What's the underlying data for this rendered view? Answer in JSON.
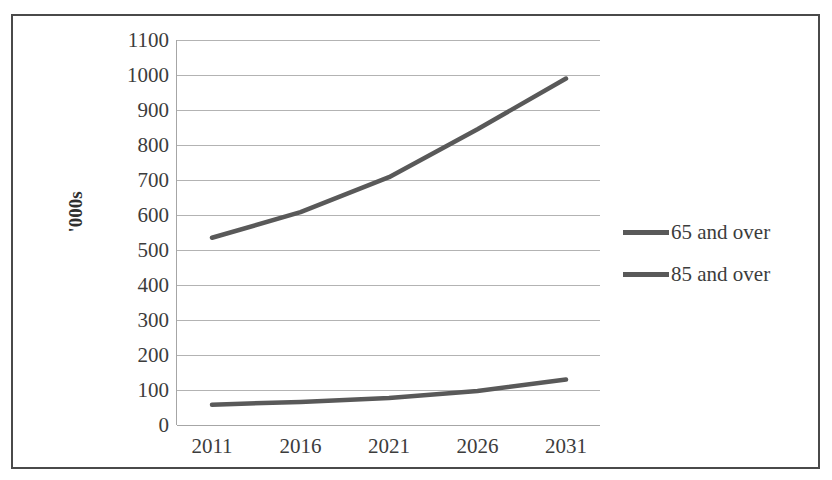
{
  "chart_data": {
    "type": "line",
    "title": "",
    "xlabel": "",
    "ylabel": "'000s",
    "categories": [
      "2011",
      "2016",
      "2021",
      "2026",
      "2031"
    ],
    "x": [
      2011,
      2016,
      2021,
      2026,
      2031
    ],
    "series": [
      {
        "name": "65 and over",
        "values": [
          535,
          608,
          708,
          845,
          990
        ],
        "color": "#595959"
      },
      {
        "name": "85 and over",
        "values": [
          58,
          66,
          77,
          97,
          130
        ],
        "color": "#595959"
      }
    ],
    "ylim": [
      0,
      1100
    ],
    "yticks": [
      1100,
      1000,
      900,
      800,
      700,
      600,
      500,
      400,
      300,
      200,
      100,
      0
    ],
    "grid": true,
    "legend_position": "right",
    "line_color": "#595959",
    "gridline_color": "#b3b3b3",
    "axis_color": "#a6a6a6",
    "frame_color": "#4a4a4a",
    "text_color": "#3c3c3c"
  },
  "legend": {
    "items": [
      {
        "label": "65 and over"
      },
      {
        "label": "85 and over"
      }
    ]
  },
  "axis": {
    "y_title": "'000s"
  }
}
